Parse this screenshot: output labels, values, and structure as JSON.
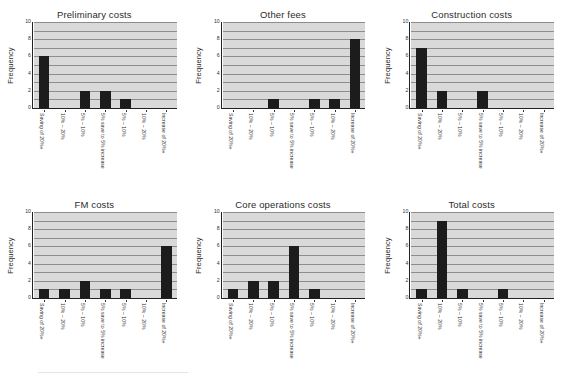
{
  "figure": {
    "panel_count": 6,
    "background_color": "#ffffff",
    "plot_background_color": "#d9d9d9",
    "bar_color": "#1c1c1c",
    "gridline_color": "#8d8d8d",
    "axis_color": "#222222"
  },
  "shared": {
    "ylabel": "Frequency",
    "ylim": [
      0,
      10
    ],
    "ytick_labels": [
      "0",
      "2",
      "4",
      "6",
      "8",
      "10"
    ],
    "ytick_values": [
      0,
      2,
      4,
      6,
      8,
      10
    ],
    "gridline_values": [
      1,
      2,
      3,
      4,
      5,
      6,
      7,
      8,
      9,
      10
    ],
    "categories": [
      "Saving of 20%+",
      "10% – 20%",
      "5% – 10%",
      "5% save to 5% increase",
      "5% – 10%",
      "10% – 20%",
      "Increase of 20%+"
    ]
  },
  "chart_data": [
    {
      "type": "bar",
      "title": "Preliminary costs",
      "xlabel": "",
      "ylabel": "Frequency",
      "ylim": [
        0,
        10
      ],
      "grid": true,
      "legend": "none",
      "categories": [
        "Saving of 20%+",
        "10% – 20%",
        "5% – 10%",
        "5% save to 5% increase",
        "5% – 10%",
        "10% – 20%",
        "Increase of 20%+"
      ],
      "values": [
        6,
        0,
        2,
        2,
        1,
        0,
        0
      ]
    },
    {
      "type": "bar",
      "title": "Other fees",
      "xlabel": "",
      "ylabel": "Frequency",
      "ylim": [
        0,
        10
      ],
      "grid": true,
      "legend": "none",
      "categories": [
        "Saving of 20%+",
        "10% – 20%",
        "5% – 10%",
        "5% save to 5% increase",
        "5% – 10%",
        "10% – 20%",
        "Increase of 20%+"
      ],
      "values": [
        0,
        0,
        1,
        0,
        1,
        1,
        8
      ]
    },
    {
      "type": "bar",
      "title": "Construction costs",
      "xlabel": "",
      "ylabel": "Frequency",
      "ylim": [
        0,
        10
      ],
      "grid": true,
      "legend": "none",
      "categories": [
        "Saving of 20%+",
        "10% – 20%",
        "5% – 10%",
        "5% save to 5% increase",
        "5% – 10%",
        "10% – 20%",
        "Increase of 20%+"
      ],
      "values": [
        7,
        2,
        0,
        2,
        0,
        0,
        0
      ]
    },
    {
      "type": "bar",
      "title": "FM costs",
      "xlabel": "",
      "ylabel": "Frequency",
      "ylim": [
        0,
        10
      ],
      "grid": true,
      "legend": "none",
      "categories": [
        "Saving of 20%+",
        "10% – 20%",
        "5% – 10%",
        "5% save to 5% increase",
        "5% – 10%",
        "10% – 20%",
        "Increase of 20%+"
      ],
      "values": [
        1,
        1,
        2,
        1,
        1,
        0,
        6
      ]
    },
    {
      "type": "bar",
      "title": "Core operations costs",
      "xlabel": "",
      "ylabel": "Frequency",
      "ylim": [
        0,
        10
      ],
      "grid": true,
      "legend": "none",
      "categories": [
        "Saving of 20%+",
        "10% – 20%",
        "5% – 10%",
        "5% save to 5% increase",
        "5% – 10%",
        "10% – 20%",
        "Increase of 20%+"
      ],
      "values": [
        1,
        2,
        2,
        6,
        1,
        0,
        0
      ]
    },
    {
      "type": "bar",
      "title": "Total costs",
      "xlabel": "",
      "ylabel": "Frequency",
      "ylim": [
        0,
        10
      ],
      "grid": true,
      "legend": "none",
      "categories": [
        "Saving of 20%+",
        "10% – 20%",
        "5% – 10%",
        "5% save to 5% increase",
        "5% – 10%",
        "10% – 20%",
        "Increase of 20%+"
      ],
      "values": [
        1,
        9,
        1,
        0,
        1,
        0,
        0
      ]
    }
  ]
}
